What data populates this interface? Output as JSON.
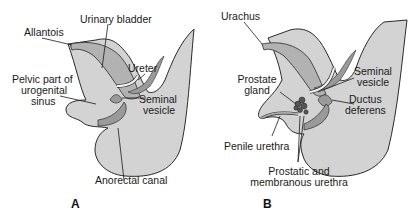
{
  "figure": {
    "panels": [
      {
        "id": "A",
        "label": "A",
        "labels": {
          "allantois": "Allantois",
          "urinary_bladder": "Urinary bladder",
          "ureter": "Ureter",
          "pelvic_part_line1": "Pelvic part of",
          "pelvic_part_line2": "urogenital",
          "pelvic_part_line3": "sinus",
          "seminal_vesicle_line1": "Seminal",
          "seminal_vesicle_line2": "vesicle",
          "anorectal_canal": "Anorectal canal"
        }
      },
      {
        "id": "B",
        "label": "B",
        "labels": {
          "urachus": "Urachus",
          "prostate_gland_line1": "Prostate",
          "prostate_gland_line2": "gland",
          "seminal_vesicle_line1": "Seminal",
          "seminal_vesicle_line2": "vesicle",
          "ductus_deferens_line1": "Ductus",
          "ductus_deferens_line2": "deferens",
          "penile_urethra": "Penile urethra",
          "prostatic_urethra_line1": "Prostatic and",
          "prostatic_urethra_line2": "membranous urethra"
        }
      }
    ],
    "colors": {
      "body_fill": "#d3d3d3",
      "organ_fill": "#b2b2b2",
      "dark_fill": "#9a9a9a",
      "outline": "#2a2a2a",
      "duct_fill": "#f2f2f2"
    }
  }
}
